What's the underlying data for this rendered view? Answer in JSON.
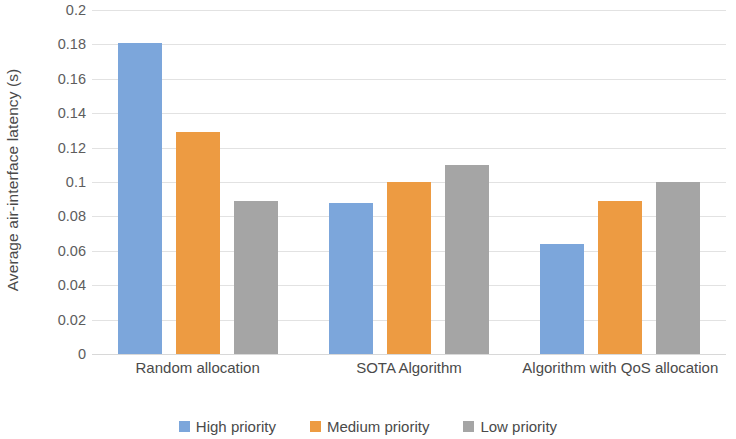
{
  "chart_data": {
    "type": "bar",
    "title": "",
    "xlabel": "",
    "ylabel": "Average air-interface latency (s)",
    "ylim": [
      0,
      0.2
    ],
    "ytick_labels": [
      "0.2",
      "0.18",
      "0.16",
      "0.14",
      "0.12",
      "0.1",
      "0.08",
      "0.06",
      "0.04",
      "0.02",
      "0"
    ],
    "ytick_values": [
      0.2,
      0.18,
      0.16,
      0.14,
      0.12,
      0.1,
      0.08,
      0.06,
      0.04,
      0.02,
      0
    ],
    "grid": true,
    "grid_axis": "y",
    "legend_position": "bottom",
    "categories": [
      "Random allocation",
      "SOTA Algorithm",
      "Algorithm with QoS allocation"
    ],
    "series": [
      {
        "name": "High priority",
        "color": "#7CA6DB",
        "values": [
          0.181,
          0.088,
          0.064
        ]
      },
      {
        "name": "Medium priority",
        "color": "#ED9B42",
        "values": [
          0.129,
          0.1,
          0.089
        ]
      },
      {
        "name": "Low priority",
        "color": "#A5A5A5",
        "values": [
          0.089,
          0.11,
          0.1
        ]
      }
    ]
  }
}
